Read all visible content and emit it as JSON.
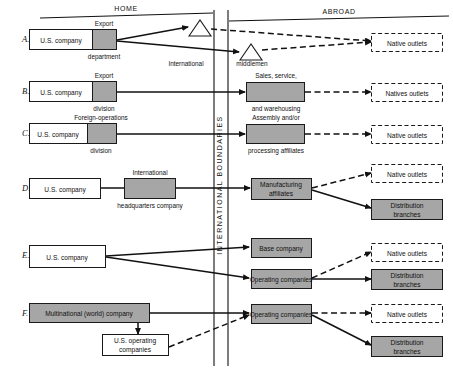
{
  "figure": {
    "headers": {
      "home": "HOME",
      "abroad": "ABROAD"
    },
    "boundary_label": "INTERNATIONAL BOUNDARIES",
    "colors": {
      "shaded_unit": "#a6a6a6",
      "line": "#111111",
      "paper": "#ffffff"
    }
  },
  "rows": [
    {
      "letter": "A.",
      "home": {
        "company": "U.S. company",
        "unit_top": "Export",
        "unit_bottom": "department"
      },
      "home_intermediary": {
        "shape": "triangle",
        "caption": "International"
      },
      "abroad_intermediary": {
        "shape": "triangle",
        "caption": "middlemen"
      },
      "abroad_outlets": [
        "Native outlets"
      ]
    },
    {
      "letter": "B.",
      "home": {
        "company": "U.S. company",
        "unit_top": "Export",
        "unit_bottom": "division"
      },
      "abroad_unit": {
        "top": "Sales, service,",
        "bottom": "and warehousing"
      },
      "abroad_outlets": [
        "Natives outlets"
      ]
    },
    {
      "letter": "C.",
      "home": {
        "company": "U.S. company",
        "unit_top": "Foreign-operations",
        "unit_bottom": "division"
      },
      "abroad_unit": {
        "top": "Assembly and/or",
        "bottom": "processing affiliates"
      },
      "abroad_outlets": [
        "Native outlets"
      ]
    },
    {
      "letter": "D.",
      "home": {
        "company": "U.S. company",
        "unit_top": "International",
        "unit_bottom": "headquarters company"
      },
      "abroad_unit_inline": "Manufacturing affiliates",
      "abroad_outlets": [
        "Native outlets"
      ],
      "abroad_branches": "Distribution branches"
    },
    {
      "letter": "E.",
      "home": {
        "company": "U.S. company"
      },
      "abroad_units_inline": [
        "Base company",
        "Operating companies"
      ],
      "abroad_outlets": [
        "Native outlets"
      ],
      "abroad_branches": "Distribution branches"
    },
    {
      "letter": "F.",
      "home": {
        "company": "Multinational (world) company",
        "subsidiary": "U.S. operating companies"
      },
      "abroad_unit_inline": "Operating companies",
      "abroad_outlets": [
        "Native outlets"
      ],
      "abroad_branches": "Distribution branches"
    }
  ]
}
